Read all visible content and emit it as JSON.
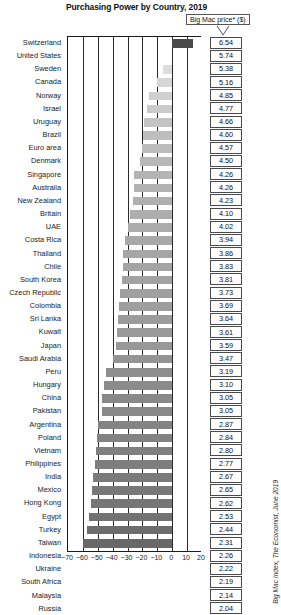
{
  "chart": {
    "title": "Purchasing Power by Country, 2019",
    "legend_label": "Big Mac price* ($)",
    "source_note": "Big Mac Index, The Economist, June 2019"
  },
  "chart_data": {
    "type": "bar",
    "orientation": "horizontal",
    "title": "Purchasing Power by Country, 2019",
    "xlabel": "",
    "ylabel": "",
    "xlim": [
      -70,
      20
    ],
    "xticks": [
      -70,
      -60,
      -50,
      -40,
      -30,
      -20,
      -10,
      0,
      10,
      20
    ],
    "xtick_labels": [
      "−70",
      "−60",
      "−50",
      "−40",
      "−30",
      "−20",
      "−10",
      "0",
      "10",
      "20"
    ],
    "grid": true,
    "legend_position": "top-right",
    "value_label_header": "Big Mac price* ($)",
    "categories": [
      "Switzerland",
      "United States",
      "Sweden",
      "Canada",
      "Norway",
      "Israel",
      "Uruguay",
      "Brazil",
      "Euro area",
      "Denmark",
      "Singapore",
      "Australia",
      "New Zealand",
      "Britain",
      "UAE",
      "Costa Rica",
      "Thailand",
      "Chile",
      "South Korea",
      "Czech Republic",
      "Colombia",
      "Sri Lanka",
      "Kuwait",
      "Japan",
      "Saudi Arabia",
      "Peru",
      "Hungary",
      "China",
      "Pakistan",
      "Argentina",
      "Poland",
      "Vietnam",
      "Philippines",
      "India",
      "Mexico",
      "Hong Kong",
      "Egypt",
      "Turkey",
      "Taiwan",
      "Indonesia",
      "Ukraine",
      "South Africa",
      "Malaysia",
      "Russia"
    ],
    "values": [
      13.9,
      0.0,
      -6.3,
      -10.1,
      -15.5,
      -16.9,
      -18.8,
      -19.9,
      -20.4,
      -21.6,
      -25.8,
      -25.8,
      -26.3,
      -28.6,
      -30.0,
      -31.4,
      -32.8,
      -33.3,
      -33.6,
      -35.0,
      -35.7,
      -36.6,
      -37.1,
      -37.5,
      -39.6,
      -44.4,
      -46.0,
      -46.9,
      -46.9,
      -50.0,
      -50.5,
      -51.2,
      -51.7,
      -53.5,
      -53.8,
      -54.4,
      -55.9,
      -57.5,
      -59.8,
      -60.6,
      -61.3,
      -61.8,
      -62.7,
      -64.5
    ],
    "bar_labels": [
      "6.54",
      "5.74",
      "5.38",
      "5.16",
      "4.85",
      "4.77",
      "4.66",
      "4.60",
      "4.57",
      "4.50",
      "4.26",
      "4.26",
      "4.23",
      "4.10",
      "4.02",
      "3.94",
      "3.86",
      "3.83",
      "3.81",
      "3.73",
      "3.69",
      "3.64",
      "3.61",
      "3.59",
      "3.47",
      "3.19",
      "3.10",
      "3.05",
      "3.05",
      "2.87",
      "2.84",
      "2.80",
      "2.77",
      "2.67",
      "2.65",
      "2.62",
      "2.53",
      "2.44",
      "2.31",
      "2.26",
      "2.22",
      "2.19",
      "2.14",
      "2.04"
    ],
    "bar_colors": [
      "#4a4a4a",
      "#ffffff",
      "#dcdcdc",
      "#d6d6d6",
      "#d0d0d0",
      "#cacaca",
      "#c4c4c4",
      "#bebebe",
      "#bcbcbc",
      "#b8b8b8",
      "#b4b4b4",
      "#b2b2b2",
      "#b0b0b0",
      "#adadad",
      "#ababab",
      "#a8a8a8",
      "#a6a6a6",
      "#a4a4a4",
      "#a2a2a2",
      "#a0a0a0",
      "#9e9e9e",
      "#9c9c9c",
      "#9a9a9a",
      "#989898",
      "#949494",
      "#8e8e8e",
      "#8b8b8b",
      "#898989",
      "#898989",
      "#848484",
      "#828282",
      "#808080",
      "#7e7e7e",
      "#7a7a7a",
      "#787878",
      "#767676",
      "#727272",
      "#6d6d6d",
      "#686868",
      "#666666",
      "#646464",
      "#626262",
      "#5f5f5f",
      "#5b5b5b"
    ]
  }
}
